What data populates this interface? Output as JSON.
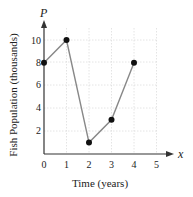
{
  "chart_data": {
    "type": "line",
    "title": "",
    "xlabel": "Time (years)",
    "ylabel": "Fish Population (thousands)",
    "x_axis_var": "x",
    "y_axis_var": "P",
    "x": [
      0,
      1,
      2,
      3,
      4
    ],
    "series": [
      {
        "name": "P",
        "values": [
          8,
          10,
          1,
          3,
          8
        ]
      }
    ],
    "xticks": [
      "0",
      "1",
      "2",
      "3",
      "4",
      "5"
    ],
    "yticks": [
      "2",
      "4",
      "6",
      "8",
      "10"
    ],
    "xlim": [
      0,
      5
    ],
    "ylim": [
      0,
      11
    ],
    "grid": true,
    "markers": true
  }
}
